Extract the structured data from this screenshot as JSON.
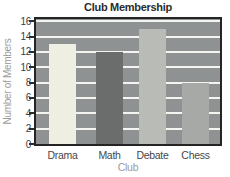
{
  "chart_data": {
    "type": "bar",
    "title": "Club Membership",
    "xlabel": "Club",
    "ylabel": "Number of Members",
    "categories": [
      "Drama",
      "Math",
      "Debate",
      "Chess"
    ],
    "values": [
      13,
      12,
      15,
      8
    ],
    "ylim": [
      0,
      16
    ],
    "yticks": [
      0,
      2,
      4,
      6,
      8,
      10,
      12,
      14,
      16
    ],
    "grid": "horizontal",
    "legend": "none",
    "bar_colors": [
      "#eeeee2",
      "#6b6d6d",
      "#b9bcb6",
      "#a6a9a6"
    ],
    "plot_bg": "#8e9292",
    "gridline_color": "#f4f4f0",
    "border_color": "#242424",
    "title_color": "#2b2b2b",
    "tick_label_color": "#3d3d3d",
    "category_label_color": "#474747",
    "axis_title_color": "#9b9b9b"
  }
}
